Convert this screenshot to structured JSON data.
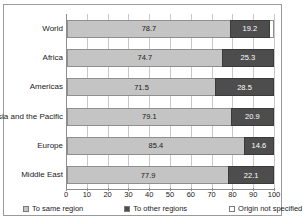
{
  "chart_data": {
    "type": "bar",
    "orientation": "horizontal",
    "stacked": true,
    "title": "",
    "xlabel": "",
    "ylabel": "",
    "xlim": [
      0,
      100
    ],
    "xticks": [
      0,
      10,
      20,
      30,
      40,
      50,
      60,
      70,
      80,
      90,
      100
    ],
    "grid": true,
    "legend_position": "bottom",
    "categories": [
      "World",
      "Africa",
      "Americas",
      "Asia and the Pacific",
      "Europe",
      "Middle East"
    ],
    "series": [
      {
        "name": "To same region",
        "color": "#c4c4c4",
        "values": [
          78.7,
          74.7,
          71.5,
          79.1,
          85.4,
          77.9
        ],
        "labels": [
          "78.7",
          "74.7",
          "71.5",
          "79.1",
          "85.4",
          "77.9"
        ]
      },
      {
        "name": "To other regions",
        "color": "#4d4d4d",
        "values": [
          19.2,
          25.3,
          28.5,
          20.9,
          14.6,
          22.1
        ],
        "labels": [
          "19.2",
          "25.3",
          "28.5",
          "20.9",
          "14.6",
          "22.1"
        ]
      },
      {
        "name": "Origin not specified",
        "color": "#ffffff",
        "values": [
          2.1,
          0,
          0,
          0,
          0,
          0
        ],
        "labels": [
          "",
          "",
          "",
          "",
          "",
          ""
        ]
      }
    ]
  },
  "legend": {
    "items": [
      {
        "label": "To same region",
        "color": "#c4c4c4"
      },
      {
        "label": "To other regions",
        "color": "#4d4d4d"
      },
      {
        "label": "Origin not specified",
        "color": "#ffffff"
      }
    ]
  },
  "axis": {
    "tick_labels": [
      "0",
      "10",
      "20",
      "30",
      "40",
      "50",
      "60",
      "70",
      "80",
      "90",
      "100"
    ]
  }
}
